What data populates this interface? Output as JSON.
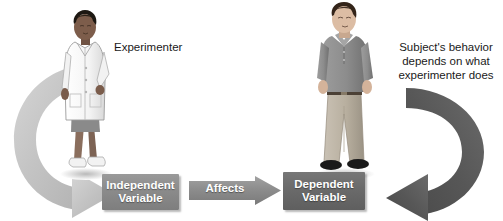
{
  "diagram": {
    "labels": {
      "experimenter": "Experimenter",
      "subject": "Subject's behavior\ndepends on what\nexperimenter does"
    },
    "boxes": {
      "independent": "Independent\nVariable",
      "dependent": "Dependent\nVariable"
    },
    "connector": {
      "affects": "Affects"
    },
    "figures": {
      "experimenter": "woman-in-lab-coat-figure",
      "subject": "standing-man-figure"
    },
    "loops": {
      "left": "left-curved-arrow",
      "right": "right-curved-arrow"
    },
    "colors": {
      "independent_box": "#8b8b8b",
      "dependent_box": "#6a6a6a",
      "affects_arrow": "#8b8b8b",
      "left_loop_arrow": "#c3c3c3",
      "right_loop_arrow": "#555555",
      "text": "#1a1a1a",
      "box_text": "#ffffff",
      "background": "#ffffff"
    }
  }
}
